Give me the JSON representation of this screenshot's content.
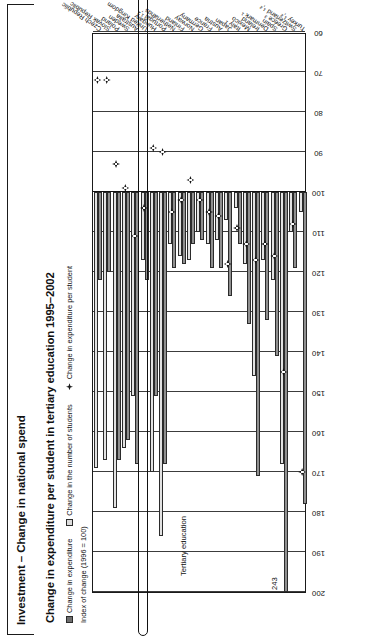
{
  "page": {
    "title": "Investment – Change in national spend"
  },
  "chart": {
    "title": "Change in expenditure per student in tertiary education 1995–2002",
    "axis_caption": "Index of change (1996 = 100)",
    "annotation_tertiary": "Tertiary education",
    "annotation_overflow": "243",
    "legend": [
      {
        "label": "Change in expenditure",
        "swatch": "dark-square-icon"
      },
      {
        "label": "Change in the number of students",
        "swatch": "light-square-icon"
      },
      {
        "label": "Change in expenditure per student",
        "swatch": "diamond-marker-icon"
      }
    ],
    "highlight_category": "United Kingdom"
  },
  "chart_data": {
    "type": "bar",
    "title": "Change in expenditure per student in tertiary education 1995–2002",
    "xlabel": "",
    "ylabel": "Index of change (1996 = 100)",
    "ylim": [
      60,
      200
    ],
    "yticks": [
      200,
      190,
      180,
      170,
      160,
      150,
      140,
      130,
      120,
      110,
      100,
      90,
      80,
      70,
      60
    ],
    "baseline": 100,
    "grid": true,
    "legend_position": "top",
    "orientation": "horizontal",
    "categories": [
      "Czech Republic",
      "Slovak Republic",
      "Poland",
      "Sweden",
      "Australia",
      "United Kingdom",
      "Hungary",
      "Portugal ¹,²",
      "Netherlands",
      "Finland",
      "Norway",
      "Germany",
      "France",
      "Austria",
      "Japan",
      "Italy ¹",
      "Mexico",
      "Ireland",
      "Denmark ¹",
      "Spain",
      "Greece ³",
      "Switzerland ¹,²",
      "Turkey ¹,²"
    ],
    "series": [
      {
        "name": "Change in expenditure",
        "values": [
          122,
          120,
          167,
          162,
          168,
          122,
          151,
          168,
          119,
          118,
          113,
          112,
          119,
          119,
          126,
          113,
          133,
          171,
          132,
          141,
          243,
          119,
          178
        ]
      },
      {
        "name": "Change in the number of students",
        "values": [
          169,
          167,
          179,
          164,
          151,
          117,
          170,
          186,
          113,
          116,
          117,
          110,
          113,
          112,
          107,
          104,
          118,
          146,
          117,
          122,
          168,
          110,
          105
        ]
      },
      {
        "name": "Change in expenditure per student",
        "values": [
          72,
          72,
          93,
          99,
          111,
          104,
          89,
          90,
          105,
          102,
          97,
          102,
          105,
          106,
          118,
          109,
          113,
          117,
          113,
          116,
          145,
          108,
          170
        ]
      }
    ]
  }
}
